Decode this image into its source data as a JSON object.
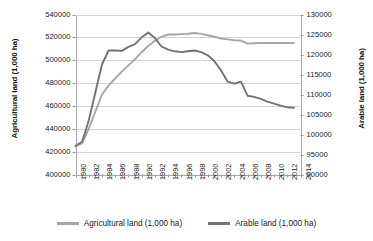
{
  "chart_data": {
    "type": "line",
    "title": "",
    "xlabel": "",
    "ylabel": "Agricultural land (1,000 ha)",
    "y2label": "Arable land (1,000 ha)",
    "grid": true,
    "legend_position": "bottom",
    "x": [
      1980,
      1981,
      1982,
      1983,
      1984,
      1985,
      1986,
      1987,
      1988,
      1989,
      1990,
      1991,
      1992,
      1993,
      1994,
      1995,
      1996,
      1997,
      1998,
      1999,
      2000,
      2001,
      2002,
      2003,
      2004,
      2005,
      2006,
      2007,
      2008,
      2009,
      2010,
      2011,
      2012,
      2013
    ],
    "x_tick_labels": [
      "1980",
      "1982",
      "1984",
      "1986",
      "1988",
      "1990",
      "1992",
      "1994",
      "1996",
      "1998",
      "2000",
      "2002",
      "2004",
      "2006",
      "2008",
      "2010",
      "2012",
      "2014"
    ],
    "xlim": [
      1980,
      2014
    ],
    "ylim": [
      400000,
      540000
    ],
    "y_tick_labels": [
      "540000",
      "520000",
      "500000",
      "480000",
      "460000",
      "440000",
      "420000",
      "400000"
    ],
    "y2lim": [
      90000,
      130000
    ],
    "y2_tick_labels": [
      "130000",
      "125000",
      "120000",
      "115000",
      "110000",
      "105000",
      "100000",
      "95000",
      "90000"
    ],
    "series": [
      {
        "name": "Agricultural land (1,000 ha)",
        "axis": "left",
        "color": "#a6a6a6",
        "values": [
          424500,
          427500,
          440000,
          455000,
          470000,
          478000,
          484000,
          490000,
          495500,
          501000,
          507000,
          512500,
          517000,
          520500,
          522500,
          522500,
          522800,
          523200,
          523800,
          523000,
          521800,
          520500,
          519000,
          518200,
          517500,
          517200,
          514500,
          514800,
          515000,
          515000,
          515000,
          515000,
          515000,
          515000
        ]
      },
      {
        "name": "Arable land (1,000 ha)",
        "axis": "right",
        "color": "#737373",
        "values": [
          97200,
          98200,
          103500,
          110500,
          117500,
          121000,
          121000,
          120900,
          121900,
          122600,
          124300,
          125500,
          124100,
          122000,
          121200,
          120800,
          120600,
          120800,
          121000,
          120600,
          119800,
          118300,
          116000,
          113200,
          112700,
          113200,
          109700,
          109400,
          108900,
          108200,
          107700,
          107200,
          106800,
          106700
        ]
      }
    ]
  },
  "legend": {
    "items": [
      {
        "label": "Agricultural land (1,000 ha)",
        "color": "#a6a6a6"
      },
      {
        "label": "Arable land (1,000 ha)",
        "color": "#737373"
      }
    ]
  }
}
